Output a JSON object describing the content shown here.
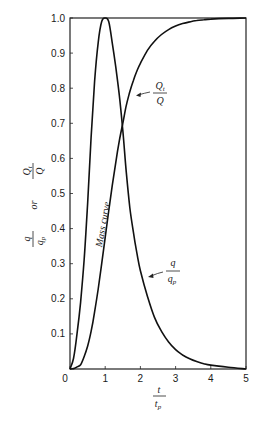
{
  "chart_data": {
    "type": "line",
    "title": "",
    "xlabel": "t / t_p",
    "ylabel": "q / q_p  or  Q_t / Q",
    "xlim": [
      0,
      5
    ],
    "ylim": [
      0,
      1.0
    ],
    "grid": false,
    "legend": "none (curves labeled directly with annotations)",
    "x_ticks": [
      "0",
      "1",
      "2",
      "3",
      "4",
      "5"
    ],
    "y_ticks": [
      "0.1",
      "0.2",
      "0.3",
      "0.4",
      "0.5",
      "0.6",
      "0.7",
      "0.8",
      "0.9",
      "1.0"
    ],
    "x": [
      0,
      0.1,
      0.2,
      0.3,
      0.4,
      0.5,
      0.6,
      0.7,
      0.8,
      0.9,
      1.0,
      1.1,
      1.2,
      1.3,
      1.4,
      1.5,
      1.6,
      1.7,
      1.8,
      1.9,
      2.0,
      2.2,
      2.4,
      2.6,
      2.8,
      3.0,
      3.2,
      3.4,
      3.6,
      3.8,
      4.0,
      4.5,
      5.0
    ],
    "series": [
      {
        "name": "q/q_p (dimensionless unit hydrograph)",
        "values": [
          0,
          0.03,
          0.1,
          0.19,
          0.31,
          0.47,
          0.66,
          0.82,
          0.93,
          0.99,
          1.0,
          0.99,
          0.93,
          0.86,
          0.78,
          0.68,
          0.56,
          0.46,
          0.39,
          0.33,
          0.28,
          0.207,
          0.147,
          0.107,
          0.077,
          0.055,
          0.04,
          0.029,
          0.021,
          0.015,
          0.011,
          0.005,
          0.0
        ]
      },
      {
        "name": "Q_t/Q (mass curve)",
        "values": [
          0,
          0.001,
          0.006,
          0.012,
          0.035,
          0.065,
          0.107,
          0.163,
          0.228,
          0.3,
          0.375,
          0.45,
          0.522,
          0.589,
          0.65,
          0.7,
          0.751,
          0.79,
          0.822,
          0.849,
          0.871,
          0.908,
          0.934,
          0.953,
          0.967,
          0.977,
          0.984,
          0.989,
          0.993,
          0.995,
          0.997,
          0.999,
          1.0
        ]
      }
    ],
    "annotations": [
      {
        "text": "Q_t / Q",
        "points_to": "mass curve",
        "at": [
          1.75,
          0.77
        ]
      },
      {
        "text": "q / q_p",
        "points_to": "hydrograph recession",
        "at": [
          2.1,
          0.34
        ]
      },
      {
        "text": "Mass curve",
        "orientation": "vertical along curve",
        "at": [
          0.85,
          0.45
        ]
      }
    ]
  },
  "labels": {
    "y_axis_q": "q",
    "y_axis_qp": "q",
    "y_axis_qp_sub": "p",
    "y_axis_or": "or",
    "y_axis_Qt": "Q",
    "y_axis_Qt_sub": "t",
    "y_axis_Q": "Q",
    "x_axis_t": "t",
    "x_axis_tp": "t",
    "x_axis_tp_sub": "p",
    "ann_Qt_num": "Q",
    "ann_Qt_sub": "t",
    "ann_Qt_den": "Q",
    "ann_q_num": "q",
    "ann_q_den": "q",
    "ann_q_den_sub": "p",
    "mass_curve": "Mass curve"
  }
}
